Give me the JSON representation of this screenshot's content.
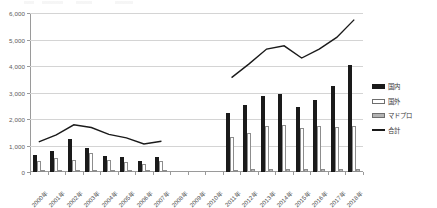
{
  "chart_data": {
    "type": "bar",
    "title": "",
    "subtitle": "",
    "xlabel": "",
    "ylabel": "",
    "ylim": [
      0,
      6000
    ],
    "ytick_step": 1000,
    "yticks": [
      0,
      1000,
      2000,
      3000,
      4000,
      5000,
      6000
    ],
    "ytick_labels": [
      "0",
      "1,000",
      "2,000",
      "3,000",
      "4,000",
      "5,000",
      "6,000"
    ],
    "grid": true,
    "legend_position": "right",
    "categories": [
      "2000年",
      "2001年",
      "2002年",
      "2003年",
      "2004年",
      "2005年",
      "2006年",
      "2007年",
      "2008年",
      "2009年",
      "2010年",
      "2011年",
      "2012年",
      "2013年",
      "2014年",
      "2015年",
      "2016年",
      "2017年",
      "2018年"
    ],
    "series": [
      {
        "name": "国内",
        "kind": "bar",
        "color": "#1a1a1a",
        "values": [
          660,
          800,
          1230,
          900,
          620,
          560,
          400,
          560,
          null,
          null,
          null,
          2220,
          2520,
          2870,
          2960,
          2440,
          2700,
          3230,
          4030
        ]
      },
      {
        "name": "国外",
        "kind": "bar",
        "color": "#ffffff",
        "values": [
          420,
          530,
          470,
          700,
          440,
          380,
          320,
          400,
          null,
          null,
          null,
          1340,
          1460,
          1750,
          1760,
          1660,
          1740,
          1680,
          1720
        ]
      },
      {
        "name": "マドプロ",
        "kind": "bar",
        "color": "#b3b3b3",
        "values": [
          60,
          70,
          80,
          80,
          60,
          50,
          50,
          60,
          null,
          null,
          null,
          90,
          100,
          110,
          110,
          100,
          110,
          110,
          120
        ]
      },
      {
        "name": "合計",
        "kind": "line",
        "color": "#1a1a1a",
        "values": [
          1140,
          1400,
          1780,
          1680,
          1420,
          1290,
          1060,
          1160,
          null,
          null,
          null,
          3560,
          4080,
          4640,
          4760,
          4300,
          4640,
          5080,
          5750
        ]
      }
    ]
  },
  "legend": {
    "items": [
      {
        "label": "国内",
        "swatch": "filled-black"
      },
      {
        "label": "国外",
        "swatch": "outline-white"
      },
      {
        "label": "マドプロ",
        "swatch": "filled-gray"
      },
      {
        "label": "合計",
        "swatch": "line-black"
      }
    ]
  }
}
